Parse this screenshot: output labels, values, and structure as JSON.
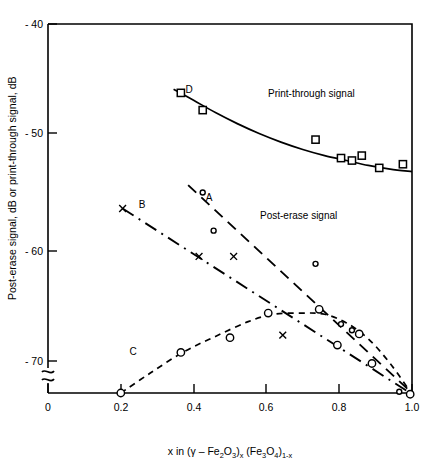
{
  "chart_data": {
    "type": "line",
    "title": "",
    "xlabel": "x in (γ – Fe2O3)x (Fe3O4)1-x",
    "ylabel": "Post-erase signal, dB or print-through signal, dB",
    "xlim": [
      0,
      1.0
    ],
    "ylim": [
      -70,
      -40
    ],
    "grid": false,
    "legend": "none",
    "xticks": [
      0,
      0.2,
      0.4,
      0.6,
      0.8,
      1.0
    ],
    "xticklabels": [
      "0",
      "0.2",
      "0.4",
      "0.6",
      "0.8",
      "1.0"
    ],
    "yticks": [
      -40,
      -50,
      -60,
      -70
    ],
    "yticklabels": [
      "- 40",
      "- 50",
      "- 60",
      "- 70"
    ],
    "y_axis_break": true,
    "annotations": [
      {
        "text": "Print-through signal",
        "x": 0.74,
        "y": -46.3
      },
      {
        "text": "Post-erase signal",
        "x": 0.71,
        "y": -57.4
      }
    ],
    "series": [
      {
        "name": "D",
        "label": "D",
        "label_x": 0.4,
        "label_y": -45.4,
        "description": "Print-through signal",
        "linestyle": "solid",
        "marker": "open-square",
        "curve": [
          [
            0.345,
            -45.3
          ],
          [
            0.4,
            -46.2
          ],
          [
            0.46,
            -47.2
          ],
          [
            0.52,
            -48.1
          ],
          [
            0.58,
            -48.9
          ],
          [
            0.64,
            -49.6
          ],
          [
            0.7,
            -50.2
          ],
          [
            0.76,
            -50.7
          ],
          [
            0.82,
            -51.1
          ],
          [
            0.88,
            -51.5
          ],
          [
            0.94,
            -51.8
          ],
          [
            1.0,
            -52.0
          ]
        ],
        "points": [
          [
            0.365,
            -45.6
          ],
          [
            0.425,
            -47.0
          ],
          [
            0.735,
            -49.4
          ],
          [
            0.805,
            -50.9
          ],
          [
            0.835,
            -51.1
          ],
          [
            0.862,
            -50.7
          ],
          [
            0.91,
            -51.7
          ],
          [
            0.975,
            -51.4
          ]
        ]
      },
      {
        "name": "A",
        "label": "A",
        "label_x": 0.455,
        "label_y": -54.3,
        "description": "Post-erase signal, long-dash trend",
        "linestyle": "long-dash",
        "marker": "small-circle",
        "curve": [
          [
            0.385,
            -53.1
          ],
          [
            1.0,
            -70.0
          ]
        ],
        "points": [
          [
            0.425,
            -53.7
          ],
          [
            0.455,
            -56.8
          ],
          [
            0.735,
            -59.5
          ],
          [
            0.805,
            -64.4
          ],
          [
            0.835,
            -64.9
          ],
          [
            0.965,
            -69.9
          ]
        ]
      },
      {
        "name": "B",
        "label": "B",
        "label_x": 0.245,
        "label_y": -55.3,
        "description": "Post-erase signal, dash-dot trend",
        "linestyle": "dash-dot",
        "marker": "cross",
        "curve": [
          [
            0.205,
            -55.0
          ],
          [
            1.0,
            -70.1
          ]
        ],
        "points": [
          [
            0.205,
            -55.0
          ],
          [
            0.415,
            -58.9
          ],
          [
            0.51,
            -58.9
          ],
          [
            0.645,
            -65.3
          ]
        ]
      },
      {
        "name": "C",
        "label": "C",
        "label_x": 0.235,
        "label_y": -67.0,
        "description": "Post-erase signal, peaked short-dash curve",
        "linestyle": "short-dash",
        "marker": "open-circle",
        "curve": [
          [
            0.2,
            -70.0
          ],
          [
            0.28,
            -68.4
          ],
          [
            0.37,
            -66.7
          ],
          [
            0.46,
            -65.4
          ],
          [
            0.55,
            -64.2
          ],
          [
            0.62,
            -63.6
          ],
          [
            0.7,
            -63.5
          ],
          [
            0.76,
            -63.6
          ],
          [
            0.82,
            -64.3
          ],
          [
            0.88,
            -65.6
          ],
          [
            0.94,
            -67.6
          ],
          [
            1.0,
            -70.1
          ]
        ],
        "points": [
          [
            0.2,
            -70.0
          ],
          [
            0.365,
            -66.7
          ],
          [
            0.5,
            -65.5
          ],
          [
            0.605,
            -63.5
          ],
          [
            0.745,
            -63.2
          ],
          [
            0.855,
            -65.2
          ],
          [
            0.795,
            -66.1
          ],
          [
            0.89,
            -67.6
          ],
          [
            0.995,
            -70.1
          ]
        ]
      }
    ]
  },
  "axis": {
    "y_label": "Post-erase signal, dB or print-through signal, dB",
    "x_label_parts": {
      "lead": "x in (",
      "gamma": "γ",
      "dash": " – Fe",
      "sub1": "2",
      "mid1": "O",
      "sub2": "3",
      "close1": ")",
      "sub3": "x",
      "mid2": " (Fe",
      "sub4": "3",
      "mid3": "O",
      "sub5": "4",
      "close2": ")",
      "sub6": "1-x"
    }
  },
  "ticks": {
    "y": [
      "- 40",
      "- 50",
      "- 60",
      "- 70"
    ],
    "x": [
      "0",
      "0.2",
      "0.4",
      "0.6",
      "0.8",
      "1.0"
    ]
  },
  "labels": {
    "print_through": "Print-through signal",
    "post_erase": "Post-erase signal",
    "curve_a": "A",
    "curve_b": "B",
    "curve_c": "C",
    "curve_d": "D"
  }
}
